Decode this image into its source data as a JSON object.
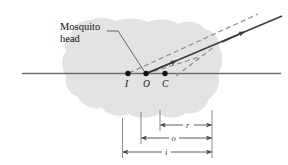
{
  "figure": {
    "background_color": "#ffffff",
    "blob": {
      "label": "mosquito-head-medium",
      "fill_color": "#e3e3e3"
    },
    "callout": {
      "line1": "Mosquito",
      "line2": "head",
      "leader_color": "#555555"
    },
    "axis": {
      "color": "#6f6f6f",
      "label": "optical-axis"
    },
    "points": [
      {
        "id": "I",
        "label": "I",
        "x": 128,
        "y": 73,
        "meaning": "image-point"
      },
      {
        "id": "O",
        "label": "O",
        "x": 146,
        "y": 73,
        "meaning": "object-point"
      },
      {
        "id": "C",
        "label": "C",
        "x": 165,
        "y": 73,
        "meaning": "center-of-curvature"
      }
    ],
    "rays": [
      {
        "id": "refracted-ray",
        "style": "solid",
        "color": "#3a3a3a",
        "has_arrow": true
      },
      {
        "id": "incident-extension-ray",
        "style": "dashed",
        "color": "#888888",
        "has_arrow": false
      },
      {
        "id": "construction-ray",
        "style": "dashed",
        "color": "#888888",
        "has_arrow": false
      }
    ],
    "dimensions": [
      {
        "id": "r",
        "label": "r",
        "from": "C",
        "to": "right-reference",
        "y": 125
      },
      {
        "id": "o",
        "label": "o",
        "from": "O",
        "to": "right-reference",
        "y": 138
      },
      {
        "id": "i",
        "label": "i",
        "from": "I",
        "to": "right-reference",
        "y": 152
      }
    ],
    "dimension_line_color": "#4a4a4a"
  }
}
